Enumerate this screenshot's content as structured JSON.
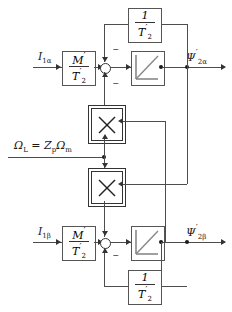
{
  "diagram": {
    "background": "#ffffff",
    "line_color": "#4d4d4d"
  },
  "inputs": {
    "alpha_current": "I",
    "alpha_current_sub": "1α",
    "beta_current": "I",
    "beta_current_sub": "1β",
    "speed_label": "Ω",
    "speed_sub": "L",
    "speed_equals": "= Z",
    "speed_zp_sub": "p",
    "speed_omega_m": "Ω",
    "speed_m_sub": "m"
  },
  "outputs": {
    "alpha_flux": "Ψ",
    "alpha_flux_prime": "′",
    "alpha_flux_sub": "2α",
    "beta_flux": "Ψ",
    "beta_flux_prime": "′",
    "beta_flux_sub": "2β"
  },
  "blocks": {
    "gain_alpha": {
      "name": "gain-m-over-t2-alpha",
      "numerator": "M",
      "numerator_prime": "′",
      "denominator": "T",
      "denominator_prime": "′",
      "denominator_sub": "2"
    },
    "gain_beta": {
      "name": "gain-m-over-t2-beta",
      "numerator": "M",
      "numerator_prime": "′",
      "denominator": "T",
      "denominator_prime": "′",
      "denominator_sub": "2"
    },
    "feedback_alpha": {
      "name": "gain-one-over-t2-alpha",
      "numerator": "1",
      "denominator": "T",
      "denominator_prime": "′",
      "denominator_sub": "2"
    },
    "feedback_beta": {
      "name": "gain-one-over-t2-beta",
      "numerator": "1",
      "denominator": "T",
      "denominator_prime": "′",
      "denominator_sub": "2"
    },
    "integrator_alpha": {
      "name": "integrator-alpha",
      "symbol": "ramp"
    },
    "integrator_beta": {
      "name": "integrator-beta",
      "symbol": "ramp"
    },
    "multiplier_top": {
      "name": "multiplier-top",
      "symbol": "×"
    },
    "multiplier_bottom": {
      "name": "multiplier-bottom",
      "symbol": "×"
    }
  },
  "signs": {
    "alpha_sum_top": "−",
    "alpha_sum_bottom": "−",
    "beta_sum_bottom": "−"
  }
}
